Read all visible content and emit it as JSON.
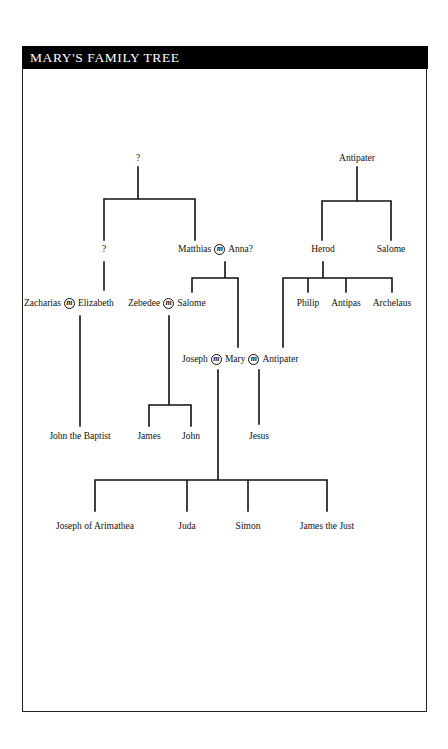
{
  "header": {
    "title": "Mary's Family Tree"
  },
  "marriage_symbol": "m",
  "tree": {
    "root_unknown": {
      "label": "?"
    },
    "antipater_elder": {
      "label": "Antipater"
    },
    "unknown_child": {
      "label": "?"
    },
    "matthias_anna": {
      "left": "Matthias",
      "right": "Anna?"
    },
    "herod": {
      "label": "Herod"
    },
    "salome_herod_sister": {
      "label": "Salome"
    },
    "zacharias_elizabeth": {
      "left": "Zacharias",
      "right": "Elizabeth"
    },
    "zebedee_salome": {
      "left": "Zebedee",
      "right": "Salome"
    },
    "herod_sons": [
      {
        "label": "Philip"
      },
      {
        "label": "Antipas"
      },
      {
        "label": "Archelaus"
      }
    ],
    "joseph_mary_antipater": {
      "left": "Joseph",
      "middle": "Mary",
      "right": "Antipater"
    },
    "john_the_baptist": {
      "label": "John the Baptist"
    },
    "zebedee_sons": [
      {
        "label": "James"
      },
      {
        "label": "John"
      }
    ],
    "jesus": {
      "label": "Jesus"
    },
    "joseph_mary_children": [
      {
        "label": "Joseph of Arimathea"
      },
      {
        "label": "Juda"
      },
      {
        "label": "Simon"
      },
      {
        "label": "James the Just"
      }
    ]
  },
  "colors": {
    "header_bg": "#000000",
    "header_text": "#ffffff",
    "line": "#111111"
  }
}
